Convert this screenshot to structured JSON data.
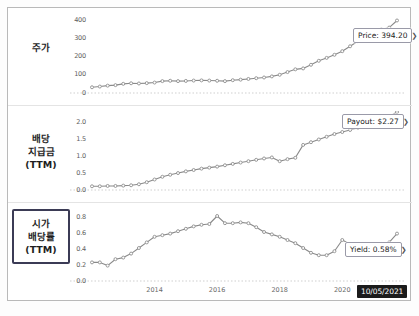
{
  "panels": [
    {
      "id": "price",
      "label": "주가",
      "label_boxed": false,
      "annotation": "Price: 394.20",
      "arrow_glyph": "❯"
    },
    {
      "id": "payout",
      "label_lines": [
        "배당",
        "지급금",
        "(TTM)"
      ],
      "label_boxed": false,
      "annotation": "Payout: $2.27",
      "arrow_glyph": "❯"
    },
    {
      "id": "yield",
      "label_lines": [
        "시가",
        "배당률",
        "(TTM)"
      ],
      "label_boxed": true,
      "annotation": "Yield: 0.58%",
      "arrow_glyph": "❯"
    }
  ],
  "date_badge": "10/05/2021",
  "footer_note": "",
  "colors": {
    "line": "#8a8a8a",
    "marker": "#8f8f8f",
    "box_highlight": "#3b3b55",
    "badge_bg": "#1b1b1b",
    "grid": "#cfcfcf"
  },
  "chart_data": [
    {
      "type": "line",
      "title": "주가",
      "xlabel": "",
      "ylabel": "주가",
      "ylim": [
        0,
        430
      ],
      "yticks": [
        "400",
        "300",
        "200",
        "100",
        "0"
      ],
      "ytick_values": [
        400,
        300,
        200,
        100,
        0
      ],
      "xticks": [
        "2014",
        "2016",
        "2018",
        "2020"
      ],
      "xtick_values": [
        2014,
        2016,
        2018,
        2020
      ],
      "grid": false,
      "last_value": 394.2,
      "annotation": "Price: 394.20",
      "x": [
        2012.0,
        2012.25,
        2012.5,
        2012.75,
        2013.0,
        2013.25,
        2013.5,
        2013.75,
        2014.0,
        2014.25,
        2014.5,
        2014.75,
        2015.0,
        2015.25,
        2015.5,
        2015.75,
        2016.0,
        2016.25,
        2016.5,
        2016.75,
        2017.0,
        2017.25,
        2017.5,
        2017.75,
        2018.0,
        2018.25,
        2018.5,
        2018.75,
        2019.0,
        2019.25,
        2019.5,
        2019.75,
        2020.0,
        2020.25,
        2020.5,
        2020.75,
        2021.0,
        2021.25,
        2021.5,
        2021.75
      ],
      "values": [
        26,
        30,
        35,
        38,
        45,
        48,
        47,
        49,
        52,
        60,
        62,
        60,
        61,
        63,
        64,
        63,
        62,
        60,
        65,
        68,
        72,
        76,
        80,
        86,
        95,
        110,
        125,
        130,
        150,
        172,
        188,
        205,
        225,
        252,
        280,
        300,
        330,
        345,
        355,
        394.2
      ]
    },
    {
      "type": "line",
      "title": "배당 지급금 (TTM)",
      "xlabel": "",
      "ylabel": "배당 지급금 (TTM)",
      "ylim": [
        0,
        2.3
      ],
      "yticks": [
        "2.0",
        "1.5",
        "1.0",
        "0.5",
        "0.0"
      ],
      "ytick_values": [
        2.0,
        1.5,
        1.0,
        0.5,
        0.0
      ],
      "xticks": [
        "2014",
        "2016",
        "2018",
        "2020"
      ],
      "xtick_values": [
        2014,
        2016,
        2018,
        2020
      ],
      "grid": false,
      "last_value": 2.27,
      "annotation": "Payout: $2.27",
      "x": [
        2012.0,
        2012.25,
        2012.5,
        2012.75,
        2013.0,
        2013.25,
        2013.5,
        2013.75,
        2014.0,
        2014.25,
        2014.5,
        2014.75,
        2015.0,
        2015.25,
        2015.5,
        2015.75,
        2016.0,
        2016.25,
        2016.5,
        2016.75,
        2017.0,
        2017.25,
        2017.5,
        2017.75,
        2018.0,
        2018.25,
        2018.5,
        2018.75,
        2019.0,
        2019.25,
        2019.5,
        2019.75,
        2020.0,
        2020.25,
        2020.5,
        2020.75,
        2021.0,
        2021.25,
        2021.5,
        2021.75
      ],
      "values": [
        0.08,
        0.08,
        0.09,
        0.09,
        0.1,
        0.11,
        0.14,
        0.2,
        0.28,
        0.36,
        0.42,
        0.47,
        0.52,
        0.56,
        0.6,
        0.63,
        0.66,
        0.7,
        0.74,
        0.78,
        0.82,
        0.86,
        0.9,
        0.93,
        0.82,
        0.88,
        0.92,
        1.3,
        1.38,
        1.46,
        1.54,
        1.62,
        1.68,
        1.74,
        1.8,
        1.86,
        1.94,
        2.02,
        2.14,
        2.27
      ]
    },
    {
      "type": "line",
      "title": "시가 배당률 (TTM)",
      "xlabel": "",
      "ylabel": "시가 배당률 (TTM)",
      "ylim": [
        0,
        0.9
      ],
      "yticks": [
        "0.8",
        "0.6",
        "0.4",
        "0.2",
        "0.0"
      ],
      "ytick_values": [
        0.8,
        0.6,
        0.4,
        0.2,
        0.0
      ],
      "xticks": [
        "2014",
        "2016",
        "2018",
        "2020"
      ],
      "xtick_values": [
        2014,
        2016,
        2018,
        2020
      ],
      "grid": false,
      "last_value": 0.58,
      "annotation": "Yield: 0.58%",
      "x": [
        2012.0,
        2012.25,
        2012.5,
        2012.75,
        2013.0,
        2013.25,
        2013.5,
        2013.75,
        2014.0,
        2014.25,
        2014.5,
        2014.75,
        2015.0,
        2015.25,
        2015.5,
        2015.75,
        2016.0,
        2016.25,
        2016.5,
        2016.75,
        2017.0,
        2017.25,
        2017.5,
        2017.75,
        2018.0,
        2018.25,
        2018.5,
        2018.75,
        2019.0,
        2019.25,
        2019.5,
        2019.75,
        2020.0,
        2020.25,
        2020.5,
        2020.75,
        2021.0,
        2021.25,
        2021.5,
        2021.75
      ],
      "values": [
        0.22,
        0.22,
        0.18,
        0.26,
        0.28,
        0.33,
        0.4,
        0.47,
        0.54,
        0.56,
        0.58,
        0.61,
        0.64,
        0.67,
        0.69,
        0.7,
        0.8,
        0.71,
        0.71,
        0.72,
        0.71,
        0.66,
        0.6,
        0.57,
        0.54,
        0.5,
        0.46,
        0.4,
        0.34,
        0.31,
        0.31,
        0.36,
        0.5,
        0.45,
        0.44,
        0.45,
        0.43,
        0.45,
        0.47,
        0.58
      ]
    }
  ]
}
